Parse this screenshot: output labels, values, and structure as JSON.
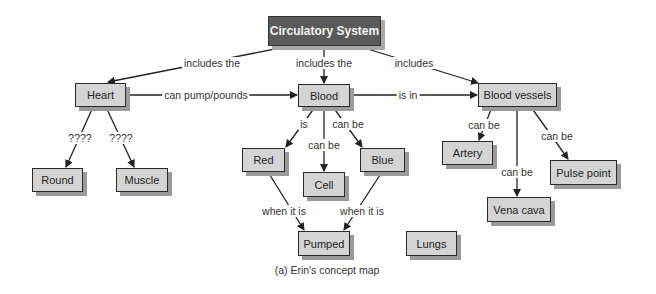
{
  "caption": "(a) Erin's concept map",
  "nodes": {
    "circulatory_system": "Circulatory System",
    "heart": "Heart",
    "blood": "Blood",
    "blood_vessels": "Blood vessels",
    "round": "Round",
    "muscle": "Muscle",
    "red": "Red",
    "cell": "Cell",
    "blue": "Blue",
    "pumped": "Pumped",
    "lungs": "Lungs",
    "artery": "Artery",
    "vena_cava": "Vena cava",
    "pulse_point": "Pulse point"
  },
  "links": {
    "cs_heart": "includes the",
    "cs_blood": "includes the",
    "cs_vessels": "includes",
    "heart_blood": "can pump/pounds",
    "blood_vessels": "is in",
    "heart_round": "????",
    "heart_muscle": "????",
    "blood_red": "is",
    "blood_cell": "can be",
    "blood_blue": "can be",
    "red_pumped": "when it is",
    "blue_pumped": "when it is",
    "vessels_artery": "can be",
    "vessels_venacava": "can be",
    "vessels_pulse": "can be"
  }
}
